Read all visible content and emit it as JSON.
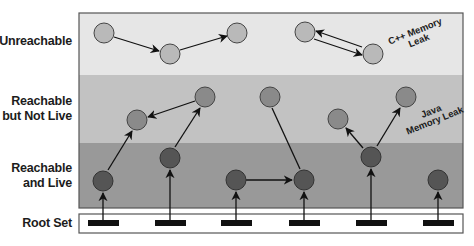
{
  "rows": [
    {
      "id": "unreachable",
      "label": "Unreachable",
      "color": "#e6e6e6"
    },
    {
      "id": "reachable-not-live",
      "label_line1": "Reachable",
      "label_line2": "but Not Live",
      "color": "#c2c2c2"
    },
    {
      "id": "reachable-live",
      "label_line1": "Reachable",
      "label_line2": "and Live",
      "color": "#999999"
    },
    {
      "id": "root-set",
      "label": "Root Set",
      "color": "#ffffff"
    }
  ],
  "annotations": {
    "cpp_leak_line1": "C++ Memory",
    "cpp_leak_line2": "Leak",
    "java_leak_line1": "Java",
    "java_leak_line2": "Memory Leak"
  },
  "node_colors": {
    "unreachable": "#b9b9b9",
    "reachable_not_live": "#8a8a8a",
    "reachable_live": "#555555"
  },
  "nodes": {
    "unreachable": [
      [
        104,
        33
      ],
      [
        170,
        54
      ],
      [
        237,
        33
      ],
      [
        305,
        32
      ],
      [
        373,
        54
      ]
    ],
    "reachable_not_live": [
      [
        137,
        120
      ],
      [
        205,
        97
      ],
      [
        270,
        97
      ],
      [
        338,
        119
      ],
      [
        406,
        97
      ]
    ],
    "reachable_live": [
      [
        103,
        181
      ],
      [
        170,
        158
      ],
      [
        236,
        180
      ],
      [
        304,
        180
      ],
      [
        371,
        157
      ],
      [
        438,
        180
      ]
    ]
  },
  "root_set_x": [
    103,
    170,
    236,
    304,
    371,
    438
  ]
}
